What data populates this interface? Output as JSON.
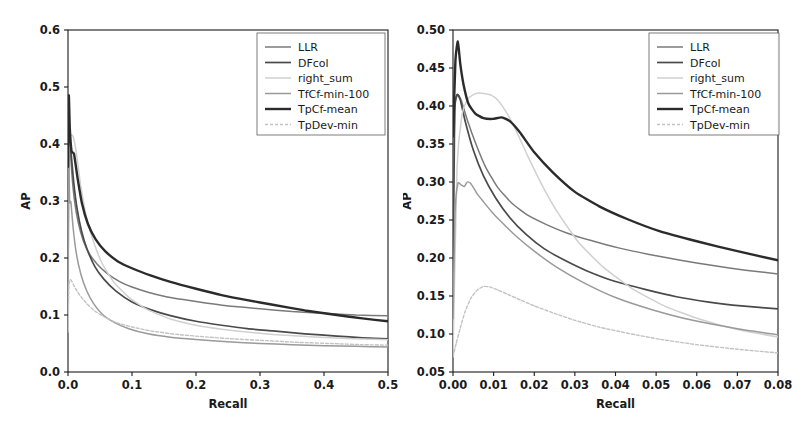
{
  "figure": {
    "background_color": "#ffffff",
    "panel_count": 2
  },
  "series_styles": {
    "LLR": {
      "color": "#7a7a7a",
      "width": 1.5,
      "dash": "none"
    },
    "DFcol": {
      "color": "#4a4a4a",
      "width": 1.7,
      "dash": "none"
    },
    "right_sum": {
      "color": "#d0d0d0",
      "width": 1.5,
      "dash": "none"
    },
    "TfCf-min-100": {
      "color": "#9a9a9a",
      "width": 1.5,
      "dash": "none"
    },
    "TpCf-mean": {
      "color": "#2b2b2b",
      "width": 2.4,
      "dash": "none"
    },
    "TpDev-min": {
      "color": "#c2c2c2",
      "width": 1.4,
      "dash": "3,2"
    }
  },
  "legend": {
    "entries": [
      {
        "label": "LLR"
      },
      {
        "label": "DFcol"
      },
      {
        "label": "right_sum"
      },
      {
        "label": "TfCf-min-100"
      },
      {
        "label": "TpCf-mean"
      },
      {
        "label": "TpDev-min"
      }
    ],
    "frame_visible": true,
    "position": "upper right"
  },
  "chart_data": [
    {
      "id": "left",
      "type": "line",
      "title": "",
      "xlabel": "Recall",
      "ylabel": "AP",
      "xlim": [
        0.0,
        0.5
      ],
      "ylim": [
        0.0,
        0.6
      ],
      "xticks": [
        0.0,
        0.1,
        0.2,
        0.3,
        0.4,
        0.5
      ],
      "xticklabels": [
        "0.0",
        "0.1",
        "0.2",
        "0.3",
        "0.4",
        "0.5"
      ],
      "yticks": [
        0.0,
        0.1,
        0.2,
        0.3,
        0.4,
        0.5,
        0.6
      ],
      "yticklabels": [
        "0.0",
        "0.1",
        "0.2",
        "0.3",
        "0.4",
        "0.5",
        "0.6"
      ],
      "grid": false,
      "legend_position": "upper right",
      "series": [
        {
          "name": "LLR",
          "x": [
            0.0,
            0.0012,
            0.003,
            0.006,
            0.01,
            0.016,
            0.024,
            0.033,
            0.045,
            0.06,
            0.08,
            0.1,
            0.125,
            0.15,
            0.18,
            0.21,
            0.25,
            0.3,
            0.35,
            0.4,
            0.45,
            0.5
          ],
          "y": [
            0.3,
            0.415,
            0.4,
            0.348,
            0.302,
            0.262,
            0.23,
            0.208,
            0.19,
            0.174,
            0.159,
            0.149,
            0.14,
            0.133,
            0.127,
            0.122,
            0.116,
            0.111,
            0.106,
            0.103,
            0.1,
            0.0985
          ]
        },
        {
          "name": "DFcol",
          "x": [
            0.0,
            0.001,
            0.0025,
            0.005,
            0.009,
            0.014,
            0.021,
            0.03,
            0.042,
            0.056,
            0.075,
            0.1,
            0.13,
            0.16,
            0.2,
            0.24,
            0.28,
            0.32,
            0.37,
            0.42,
            0.46,
            0.5
          ],
          "y": [
            0.143,
            0.41,
            0.418,
            0.382,
            0.332,
            0.288,
            0.248,
            0.215,
            0.185,
            0.163,
            0.142,
            0.123,
            0.109,
            0.099,
            0.089,
            0.082,
            0.076,
            0.072,
            0.067,
            0.063,
            0.06,
            0.058
          ]
        },
        {
          "name": "right_sum",
          "x": [
            0.0,
            0.002,
            0.0045,
            0.008,
            0.013,
            0.02,
            0.029,
            0.04,
            0.054,
            0.072,
            0.095,
            0.125,
            0.16,
            0.2,
            0.24,
            0.28,
            0.32,
            0.36,
            0.41,
            0.46,
            0.5
          ],
          "y": [
            0.07,
            0.394,
            0.415,
            0.413,
            0.385,
            0.326,
            0.271,
            0.228,
            0.189,
            0.157,
            0.131,
            0.109,
            0.093,
            0.082,
            0.075,
            0.07,
            0.066,
            0.063,
            0.06,
            0.058,
            0.0565
          ]
        },
        {
          "name": "TfCf-min-100",
          "x": [
            0.0,
            0.001,
            0.0025,
            0.0045,
            0.008,
            0.013,
            0.02,
            0.029,
            0.04,
            0.054,
            0.072,
            0.095,
            0.125,
            0.16,
            0.2,
            0.25,
            0.3,
            0.35,
            0.4,
            0.45,
            0.5
          ],
          "y": [
            0.12,
            0.398,
            0.3,
            0.298,
            0.253,
            0.208,
            0.172,
            0.143,
            0.12,
            0.101,
            0.087,
            0.076,
            0.067,
            0.061,
            0.057,
            0.053,
            0.05,
            0.048,
            0.046,
            0.045,
            0.044
          ]
        },
        {
          "name": "TpCf-mean",
          "x": [
            0.0,
            0.0012,
            0.0028,
            0.0055,
            0.0095,
            0.015,
            0.022,
            0.031,
            0.043,
            0.058,
            0.078,
            0.1,
            0.13,
            0.16,
            0.2,
            0.24,
            0.28,
            0.32,
            0.37,
            0.42,
            0.46,
            0.5
          ],
          "y": [
            0.36,
            0.485,
            0.428,
            0.388,
            0.382,
            0.34,
            0.295,
            0.26,
            0.233,
            0.212,
            0.194,
            0.182,
            0.169,
            0.158,
            0.146,
            0.135,
            0.126,
            0.118,
            0.108,
            0.1,
            0.094,
            0.089
          ]
        },
        {
          "name": "TpDev-min",
          "x": [
            0.0,
            0.0015,
            0.0035,
            0.006,
            0.009,
            0.014,
            0.021,
            0.03,
            0.042,
            0.056,
            0.075,
            0.1,
            0.13,
            0.17,
            0.21,
            0.26,
            0.31,
            0.36,
            0.41,
            0.46,
            0.5
          ],
          "y": [
            0.075,
            0.152,
            0.162,
            0.159,
            0.152,
            0.142,
            0.131,
            0.119,
            0.107,
            0.097,
            0.087,
            0.079,
            0.072,
            0.066,
            0.062,
            0.058,
            0.055,
            0.052,
            0.05,
            0.048,
            0.047
          ]
        }
      ]
    },
    {
      "id": "right",
      "type": "line",
      "title": "",
      "xlabel": "Recall",
      "ylabel": "AP",
      "xlim": [
        0.0,
        0.08
      ],
      "ylim": [
        0.05,
        0.5
      ],
      "xticks": [
        0.0,
        0.01,
        0.02,
        0.03,
        0.04,
        0.05,
        0.06,
        0.07,
        0.08
      ],
      "xticklabels": [
        "0.00",
        "0.01",
        "0.02",
        "0.03",
        "0.04",
        "0.05",
        "0.06",
        "0.07",
        "0.08"
      ],
      "yticks": [
        0.05,
        0.1,
        0.15,
        0.2,
        0.25,
        0.3,
        0.35,
        0.4,
        0.45,
        0.5
      ],
      "yticklabels": [
        "0.05",
        "0.10",
        "0.15",
        "0.20",
        "0.25",
        "0.30",
        "0.35",
        "0.40",
        "0.45",
        "0.50"
      ],
      "grid": false,
      "legend_position": "upper right",
      "series": [
        {
          "name": "LLR",
          "x": [
            0.0,
            0.0005,
            0.0012,
            0.002,
            0.0035,
            0.0055,
            0.008,
            0.011,
            0.0145,
            0.0185,
            0.023,
            0.028,
            0.034,
            0.041,
            0.048,
            0.056,
            0.064,
            0.072,
            0.08
          ],
          "y": [
            0.3,
            0.4,
            0.415,
            0.408,
            0.382,
            0.352,
            0.32,
            0.293,
            0.272,
            0.256,
            0.244,
            0.233,
            0.223,
            0.213,
            0.205,
            0.197,
            0.19,
            0.184,
            0.179
          ]
        },
        {
          "name": "DFcol",
          "x": [
            0.0,
            0.0004,
            0.001,
            0.0018,
            0.003,
            0.005,
            0.0075,
            0.0105,
            0.014,
            0.018,
            0.0225,
            0.0275,
            0.033,
            0.04,
            0.047,
            0.055,
            0.063,
            0.071,
            0.08
          ],
          "y": [
            0.143,
            0.39,
            0.415,
            0.408,
            0.38,
            0.342,
            0.308,
            0.279,
            0.253,
            0.231,
            0.212,
            0.197,
            0.183,
            0.169,
            0.159,
            0.149,
            0.142,
            0.137,
            0.133
          ]
        },
        {
          "name": "right_sum",
          "x": [
            0.0,
            0.001,
            0.0022,
            0.0035,
            0.005,
            0.0065,
            0.008,
            0.0095,
            0.011,
            0.013,
            0.0155,
            0.0185,
            0.022,
            0.026,
            0.031,
            0.037,
            0.044,
            0.052,
            0.061,
            0.07,
            0.08
          ],
          "y": [
            0.07,
            0.32,
            0.388,
            0.408,
            0.415,
            0.417,
            0.416,
            0.414,
            0.408,
            0.393,
            0.368,
            0.333,
            0.295,
            0.258,
            0.22,
            0.188,
            0.16,
            0.137,
            0.119,
            0.106,
            0.096
          ]
        },
        {
          "name": "TfCf-min-100",
          "x": [
            0.0,
            0.0005,
            0.0012,
            0.002,
            0.0028,
            0.0035,
            0.0042,
            0.005,
            0.006,
            0.0075,
            0.0095,
            0.012,
            0.0155,
            0.02,
            0.0255,
            0.032,
            0.04,
            0.049,
            0.059,
            0.07,
            0.08
          ],
          "y": [
            0.12,
            0.26,
            0.298,
            0.296,
            0.294,
            0.3,
            0.299,
            0.293,
            0.284,
            0.274,
            0.261,
            0.247,
            0.229,
            0.209,
            0.188,
            0.168,
            0.148,
            0.132,
            0.118,
            0.107,
            0.099
          ]
        },
        {
          "name": "TpCf-mean",
          "x": [
            0.0,
            0.0006,
            0.0012,
            0.0018,
            0.0026,
            0.0038,
            0.0055,
            0.0075,
            0.0098,
            0.012,
            0.014,
            0.0165,
            0.02,
            0.0245,
            0.03,
            0.036,
            0.043,
            0.051,
            0.06,
            0.07,
            0.08
          ],
          "y": [
            0.36,
            0.46,
            0.485,
            0.455,
            0.428,
            0.403,
            0.39,
            0.384,
            0.383,
            0.385,
            0.38,
            0.365,
            0.339,
            0.313,
            0.287,
            0.268,
            0.251,
            0.235,
            0.222,
            0.209,
            0.197
          ]
        },
        {
          "name": "TpDev-min",
          "x": [
            0.0,
            0.0008,
            0.0018,
            0.003,
            0.0045,
            0.006,
            0.0075,
            0.009,
            0.011,
            0.0135,
            0.0165,
            0.02,
            0.0245,
            0.03,
            0.036,
            0.043,
            0.051,
            0.06,
            0.07,
            0.08
          ],
          "y": [
            0.07,
            0.088,
            0.108,
            0.13,
            0.148,
            0.158,
            0.1625,
            0.162,
            0.158,
            0.152,
            0.145,
            0.137,
            0.128,
            0.118,
            0.109,
            0.101,
            0.093,
            0.086,
            0.08,
            0.075
          ]
        }
      ]
    }
  ]
}
